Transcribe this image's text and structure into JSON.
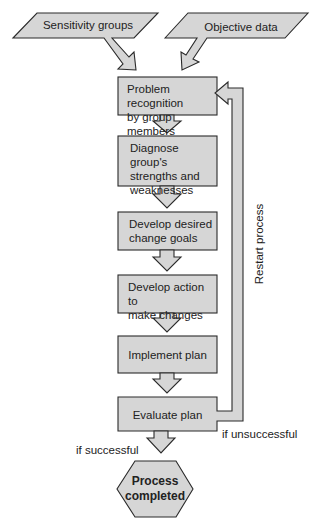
{
  "colors": {
    "fill": "#d4d4d4",
    "stroke": "#2a2a2a",
    "text": "#222222",
    "background": "#ffffff"
  },
  "inputs": [
    {
      "label": "Sensitivity groups",
      "shape": "parallelogram"
    },
    {
      "label": "Objective data",
      "shape": "parallelogram"
    }
  ],
  "steps": [
    {
      "label_lines": [
        "Problem recognition",
        "by group members"
      ]
    },
    {
      "label_lines": [
        "Diagnose group's",
        "strengths and",
        "weaknesses"
      ]
    },
    {
      "label_lines": [
        "Develop desired",
        "change goals"
      ]
    },
    {
      "label_lines": [
        "Develop action to",
        "make changes"
      ]
    },
    {
      "label_lines": [
        "Implement plan"
      ]
    },
    {
      "label_lines": [
        "Evaluate plan"
      ]
    }
  ],
  "terminal": {
    "label_lines": [
      "Process",
      "completed"
    ],
    "shape": "hexagon"
  },
  "feedback": {
    "loop_label": "Restart process",
    "condition_label": "if unsuccessful"
  },
  "success_label": "if successful"
}
